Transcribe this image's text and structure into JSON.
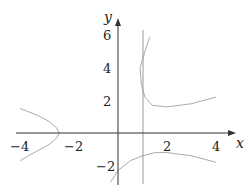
{
  "chart_data": {
    "type": "line",
    "title": "",
    "xlabel": "x",
    "ylabel": "y",
    "xlim": [
      -4.3,
      4.5
    ],
    "ylim": [
      -3.2,
      6.5
    ],
    "xticks": [
      "-4",
      "-2",
      "2",
      "4"
    ],
    "yticks": [
      "6",
      "4",
      "2",
      "-2"
    ],
    "grid": false,
    "asymptote_x": 1,
    "series": [
      {
        "name": "left-branch",
        "x": [
          -4.0,
          -3.3,
          -2.8,
          -2.5,
          -2.4,
          -2.5,
          -2.8,
          -3.3,
          -4.0
        ],
        "y": [
          1.5,
          1.1,
          0.7,
          0.3,
          0.0,
          -0.3,
          -0.7,
          -1.1,
          -1.7
        ]
      },
      {
        "name": "upper-right-branch",
        "x": [
          1.3,
          1.1,
          0.9,
          0.95,
          1.1,
          1.4,
          2.0,
          3.0,
          4.0
        ],
        "y": [
          5.9,
          5.0,
          4.0,
          3.0,
          2.2,
          1.7,
          1.6,
          1.8,
          2.2
        ]
      },
      {
        "name": "lower-branch",
        "x": [
          -0.3,
          0.0,
          0.5,
          1.0,
          1.5,
          2.0,
          3.0,
          4.0
        ],
        "y": [
          -3.0,
          -2.3,
          -1.7,
          -1.4,
          -1.2,
          -1.2,
          -1.4,
          -1.8
        ]
      }
    ]
  }
}
